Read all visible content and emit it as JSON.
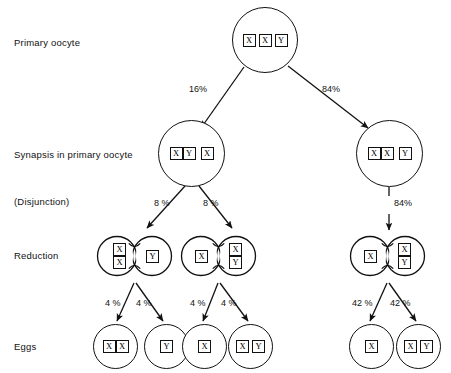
{
  "diagram": {
    "stroke_color": "#111111",
    "background_color": "#ffffff",
    "row_labels": [
      {
        "id": "primary-oocyte",
        "text": "Primary  oocyte"
      },
      {
        "id": "synapsis",
        "text": "Synapsis in primary oocyte"
      },
      {
        "id": "disjunction",
        "text": "(Disjunction)"
      },
      {
        "id": "reduction",
        "text": "Reduction"
      },
      {
        "id": "eggs",
        "text": "Eggs"
      }
    ],
    "primary_oocyte": {
      "chromosomes": [
        "X",
        "X",
        "Y"
      ]
    },
    "synapsis": [
      {
        "id": "synapsis-left",
        "pair": [
          "X",
          "Y"
        ],
        "single": [
          "X"
        ]
      },
      {
        "id": "synapsis-right",
        "pair": [
          "X",
          "X"
        ],
        "single": [
          "Y"
        ]
      }
    ],
    "reduction": [
      {
        "id": "reduction-1",
        "left_lobe": [
          "X",
          "X"
        ],
        "left_lobe_stacked": true,
        "right_lobe": [
          "Y"
        ],
        "right_lobe_stacked": false
      },
      {
        "id": "reduction-2",
        "left_lobe": [
          "X"
        ],
        "left_lobe_stacked": false,
        "right_lobe": [
          "X",
          "Y"
        ],
        "right_lobe_stacked": true
      },
      {
        "id": "reduction-3",
        "left_lobe": [
          "X"
        ],
        "left_lobe_stacked": false,
        "right_lobe": [
          "X",
          "Y"
        ],
        "right_lobe_stacked": true
      }
    ],
    "eggs": [
      {
        "id": "egg-1",
        "chromosomes": [
          "X",
          "X"
        ],
        "joined": true
      },
      {
        "id": "egg-2",
        "chromosomes": [
          "Y"
        ],
        "joined": false
      },
      {
        "id": "egg-3",
        "chromosomes": [
          "X"
        ],
        "joined": false
      },
      {
        "id": "egg-4",
        "chromosomes": [
          "X",
          "Y"
        ],
        "joined": false
      },
      {
        "id": "egg-5",
        "chromosomes": [
          "X"
        ],
        "joined": false
      },
      {
        "id": "egg-6",
        "chromosomes": [
          "X",
          "Y"
        ],
        "joined": false
      }
    ],
    "percentages": {
      "oocyte_to_synapsis_left": "16%",
      "oocyte_to_synapsis_right": "84%",
      "synapsis_left_to_reduction_1": "8 %",
      "synapsis_left_to_reduction_2": "8 %",
      "synapsis_right_to_reduction_3": "84%",
      "reduction_1_to_egg_1": "4 %",
      "reduction_1_to_egg_2": "4 %",
      "reduction_2_to_egg_3": "4 %",
      "reduction_2_to_egg_4": "4 %",
      "reduction_3_to_egg_5": "42 %",
      "reduction_3_to_egg_6": "42 %"
    }
  }
}
